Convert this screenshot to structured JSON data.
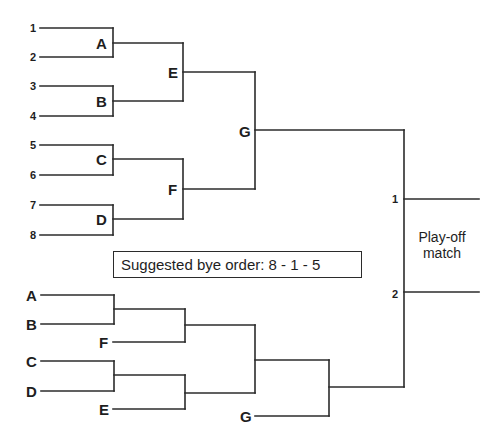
{
  "diagram": {
    "type": "tournament-bracket",
    "line_color": "#2b2b2b",
    "main_bracket": {
      "seeds": [
        {
          "label": "1",
          "x": 30,
          "y": 28
        },
        {
          "label": "2",
          "x": 30,
          "y": 57
        },
        {
          "label": "3",
          "x": 30,
          "y": 86
        },
        {
          "label": "4",
          "x": 30,
          "y": 116
        },
        {
          "label": "5",
          "x": 30,
          "y": 145
        },
        {
          "label": "6",
          "x": 30,
          "y": 175
        },
        {
          "label": "7",
          "x": 30,
          "y": 205
        },
        {
          "label": "8",
          "x": 30,
          "y": 235
        }
      ],
      "matches": [
        {
          "label": "A",
          "x": 96,
          "y": 43
        },
        {
          "label": "B",
          "x": 96,
          "y": 101
        },
        {
          "label": "C",
          "x": 96,
          "y": 159
        },
        {
          "label": "D",
          "x": 96,
          "y": 219
        },
        {
          "label": "E",
          "x": 168,
          "y": 72
        },
        {
          "label": "F",
          "x": 168,
          "y": 189
        },
        {
          "label": "G",
          "x": 239,
          "y": 131
        }
      ]
    },
    "consolation_bracket": {
      "entries": [
        {
          "label": "A",
          "x": 26,
          "y": 295
        },
        {
          "label": "B",
          "x": 26,
          "y": 324
        },
        {
          "label": "F",
          "x": 99,
          "y": 342
        },
        {
          "label": "C",
          "x": 26,
          "y": 361
        },
        {
          "label": "D",
          "x": 26,
          "y": 391
        },
        {
          "label": "E",
          "x": 99,
          "y": 409
        },
        {
          "label": "G",
          "x": 240,
          "y": 416
        }
      ]
    },
    "playoff": {
      "slots": [
        {
          "label": "1",
          "x": 392,
          "y": 199
        },
        {
          "label": "2",
          "x": 392,
          "y": 294
        }
      ],
      "title_line1": "Play-off",
      "title_line2": "match"
    },
    "note": {
      "text": "Suggested bye order: 8 - 1 - 5"
    },
    "lines": [
      [
        40,
        28,
        113,
        28
      ],
      [
        40,
        57,
        113,
        57
      ],
      [
        113,
        28,
        113,
        57
      ],
      [
        113,
        43,
        183,
        43
      ],
      [
        40,
        86,
        113,
        86
      ],
      [
        40,
        116,
        113,
        116
      ],
      [
        113,
        86,
        113,
        116
      ],
      [
        113,
        101,
        183,
        101
      ],
      [
        183,
        43,
        183,
        101
      ],
      [
        183,
        72,
        255,
        72
      ],
      [
        40,
        145,
        113,
        145
      ],
      [
        40,
        175,
        113,
        175
      ],
      [
        113,
        145,
        113,
        175
      ],
      [
        113,
        159,
        183,
        159
      ],
      [
        40,
        205,
        113,
        205
      ],
      [
        40,
        235,
        113,
        235
      ],
      [
        113,
        205,
        113,
        235
      ],
      [
        113,
        219,
        183,
        219
      ],
      [
        183,
        159,
        183,
        219
      ],
      [
        183,
        189,
        255,
        189
      ],
      [
        255,
        72,
        255,
        189
      ],
      [
        255,
        130,
        404,
        130
      ],
      [
        404,
        130,
        404,
        387
      ],
      [
        404,
        199,
        479,
        199
      ],
      [
        404,
        292,
        479,
        292
      ],
      [
        41,
        295,
        114,
        295
      ],
      [
        41,
        324,
        114,
        324
      ],
      [
        114,
        295,
        114,
        324
      ],
      [
        114,
        309,
        185,
        309
      ],
      [
        113,
        342,
        185,
        342
      ],
      [
        185,
        309,
        185,
        342
      ],
      [
        185,
        325,
        255,
        325
      ],
      [
        41,
        361,
        114,
        361
      ],
      [
        41,
        391,
        114,
        391
      ],
      [
        114,
        361,
        114,
        391
      ],
      [
        114,
        375,
        185,
        375
      ],
      [
        113,
        409,
        185,
        409
      ],
      [
        185,
        375,
        185,
        409
      ],
      [
        185,
        393,
        255,
        393
      ],
      [
        255,
        325,
        255,
        393
      ],
      [
        255,
        360,
        329,
        360
      ],
      [
        255,
        416,
        329,
        416
      ],
      [
        329,
        360,
        329,
        416
      ],
      [
        329,
        387,
        404,
        387
      ]
    ]
  }
}
